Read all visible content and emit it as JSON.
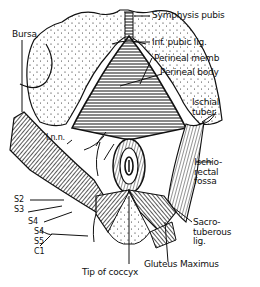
{
  "figure": {
    "type": "anatomical line drawing",
    "colors": {
      "ink": "#111111",
      "background": "#ffffff"
    }
  },
  "labels": {
    "symphysis_pubis": "Symphysis pubis",
    "inf_pubic_lig": "Inf. pubic lig.",
    "perineal_memb": "Perineal memb",
    "perineal_body": "Perineal body",
    "bursa": "Bursa",
    "ischial_tuber": "Ischial\ntuber.",
    "ischiorectal_fossa": "Ischio-\nrectal\nfossa",
    "inn": "I.n.n.",
    "s2": "S2",
    "s3": "S3",
    "s4_upper": "S4",
    "s4": "S4",
    "s5": "S5",
    "c1": "C1",
    "sacrotuberous_lig": "Sacro-\ntuberous\nlig.",
    "gluteus_maximus": "Gluteus Maximus",
    "tip_of_coccyx": "Tip of coccyx"
  }
}
